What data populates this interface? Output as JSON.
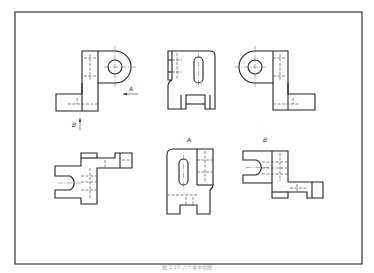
{
  "figure": {
    "caption": "图 2-15 六个基本视图",
    "colors": {
      "line": "#222222",
      "background": "#ffffff"
    }
  },
  "views": [
    {
      "id": "front",
      "position": "top-left"
    },
    {
      "id": "left",
      "position": "top-middle"
    },
    {
      "id": "right",
      "position": "top-right"
    },
    {
      "id": "top",
      "position": "bottom-left"
    },
    {
      "id": "rear-A",
      "position": "bottom-middle",
      "label": "A"
    },
    {
      "id": "bottom-B",
      "position": "bottom-right",
      "label": "B"
    }
  ],
  "annotations": {
    "arrow_a_label": "A",
    "arrow_b_label": "B",
    "view_a_label": "A",
    "view_b_label": "B"
  }
}
